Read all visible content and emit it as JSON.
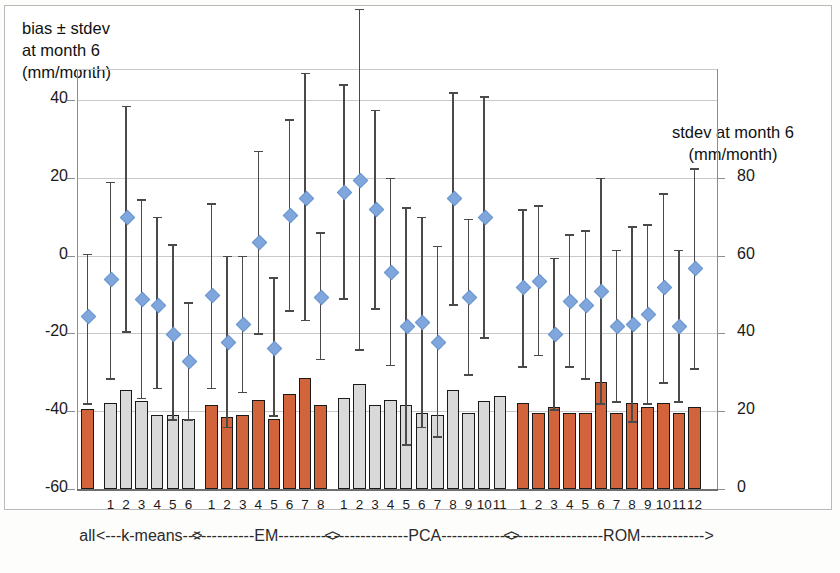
{
  "figure": {
    "left_axis_title": "bias ± stdev\nat month 6\n(mm/month)",
    "right_axis_title": "stdev at month 6\n(mm/month)"
  },
  "axes": {
    "left_ticks": [
      "40",
      "20",
      "0",
      "-20",
      "-40",
      "-60"
    ],
    "left_values": [
      40,
      20,
      0,
      -20,
      -40,
      -60
    ],
    "right_ticks": [
      "80",
      "60",
      "40",
      "20",
      "0"
    ],
    "right_values": [
      80,
      60,
      40,
      20,
      0
    ]
  },
  "groups": [
    {
      "name": "all",
      "label": "all",
      "color": "orange",
      "count": 1
    },
    {
      "name": "k-means",
      "label": "<---k-means-->",
      "color": "grey",
      "count": 6
    },
    {
      "name": "EM",
      "label": "<----------EM---------->",
      "color": "orange",
      "count": 8
    },
    {
      "name": "PCA",
      "label": "<--------------PCA------------->",
      "color": "grey",
      "count": 11
    },
    {
      "name": "ROM",
      "label": "<-----------------ROM------------>",
      "color": "orange",
      "count": 12
    }
  ],
  "chart_data": {
    "type": "bar",
    "title": "",
    "subtitle": "",
    "xlabel": "",
    "ylabel": "bias ± stdev at month 6 (mm/month)",
    "y2label": "stdev at month 6 (mm/month)",
    "ylim": [
      -60,
      48
    ],
    "y2lim": [
      0,
      108
    ],
    "grid": true,
    "legend": "none",
    "categories": [
      "all",
      "k1",
      "k2",
      "k3",
      "k4",
      "k5",
      "k6",
      "EM1",
      "EM2",
      "EM3",
      "EM4",
      "EM5",
      "EM6",
      "EM7",
      "EM8",
      "PCA1",
      "PCA2",
      "PCA3",
      "PCA4",
      "PCA5",
      "PCA6",
      "PCA7",
      "PCA8",
      "PCA9",
      "PCA10",
      "PCA11",
      "ROM1",
      "ROM2",
      "ROM3",
      "ROM4",
      "ROM5",
      "ROM6",
      "ROM7",
      "ROM8",
      "ROM9",
      "ROM10",
      "ROM11",
      "ROM12"
    ],
    "tick_labels": [
      "",
      "1",
      "2",
      "3",
      "4",
      "5",
      "6",
      "1",
      "2",
      "3",
      "4",
      "5",
      "6",
      "7",
      "8",
      "1",
      "2",
      "3",
      "4",
      "5",
      "6",
      "7",
      "8",
      "9",
      "10",
      "11",
      "1",
      "2",
      "3",
      "4",
      "5",
      "6",
      "7",
      "8",
      "9",
      "10",
      "11",
      "12"
    ],
    "series": [
      {
        "name": "stdev at month 6 (bars, right axis)",
        "axis": "right",
        "type": "bar",
        "colors": [
          "orange",
          "grey",
          "grey",
          "grey",
          "grey",
          "grey",
          "grey",
          "orange",
          "orange",
          "orange",
          "orange",
          "orange",
          "orange",
          "orange",
          "orange",
          "grey",
          "grey",
          "grey",
          "grey",
          "grey",
          "grey",
          "grey",
          "grey",
          "grey",
          "grey",
          "grey",
          "orange",
          "orange",
          "orange",
          "orange",
          "orange",
          "orange",
          "orange",
          "orange",
          "orange",
          "orange",
          "orange",
          "orange"
        ],
        "values": [
          20.5,
          22.0,
          25.5,
          22.5,
          19.0,
          19.0,
          18.0,
          21.5,
          18.5,
          19.0,
          23.0,
          18.0,
          24.5,
          28.5,
          21.5,
          23.5,
          27.0,
          21.5,
          23.0,
          21.5,
          19.5,
          19.0,
          25.5,
          19.5,
          22.5,
          24.0,
          22.0,
          19.5,
          21.0,
          19.5,
          19.5,
          27.5,
          19.5,
          22.0,
          21.0,
          22.0,
          19.5,
          21.0
        ]
      },
      {
        "name": "bias at month 6 (diamonds, left axis)",
        "axis": "left",
        "type": "scatter",
        "values": [
          -15.5,
          -6.0,
          10.0,
          -11.0,
          -12.5,
          -20.0,
          -27.0,
          -10.0,
          -22.0,
          -17.5,
          3.5,
          -23.5,
          10.5,
          15.0,
          -10.5,
          16.5,
          19.5,
          12.0,
          -4.0,
          -18.0,
          -17.0,
          -22.0,
          15.0,
          -10.5,
          10.0,
          null,
          -8.0,
          -6.5,
          -20.0,
          -11.5,
          -12.5,
          -9.0,
          -18.0,
          -17.5,
          -15.0,
          -8.0,
          -18.0,
          -3.0
        ]
      },
      {
        "name": "bias error bar upper (left axis)",
        "axis": "left",
        "type": "errorbar-high",
        "values": [
          0.5,
          19.0,
          38.5,
          14.5,
          10.0,
          3.0,
          -12.0,
          13.5,
          0.0,
          0.0,
          27.0,
          -5.5,
          35.0,
          47.0,
          6.0,
          44.0,
          63.5,
          37.5,
          20.0,
          12.5,
          10.0,
          2.5,
          42.0,
          9.5,
          41.0,
          null,
          12.0,
          13.0,
          -0.5,
          5.5,
          6.5,
          20.0,
          1.5,
          7.5,
          8.0,
          16.0,
          1.5,
          22.5
        ]
      },
      {
        "name": "bias error bar lower (left axis)",
        "axis": "left",
        "type": "errorbar-low",
        "values": [
          -38.0,
          -31.5,
          -19.5,
          -36.5,
          -34.0,
          -42.0,
          -42.0,
          -34.0,
          -44.0,
          -35.0,
          -20.0,
          -41.0,
          -14.0,
          -16.5,
          -26.5,
          -11.0,
          -24.0,
          -13.5,
          -28.0,
          -48.5,
          -44.0,
          -46.5,
          -12.5,
          -30.5,
          -21.0,
          null,
          -28.5,
          -25.5,
          -39.5,
          -28.5,
          -31.5,
          -38.0,
          -37.5,
          -42.5,
          -38.0,
          -32.5,
          -37.5,
          -29.0
        ]
      }
    ]
  }
}
